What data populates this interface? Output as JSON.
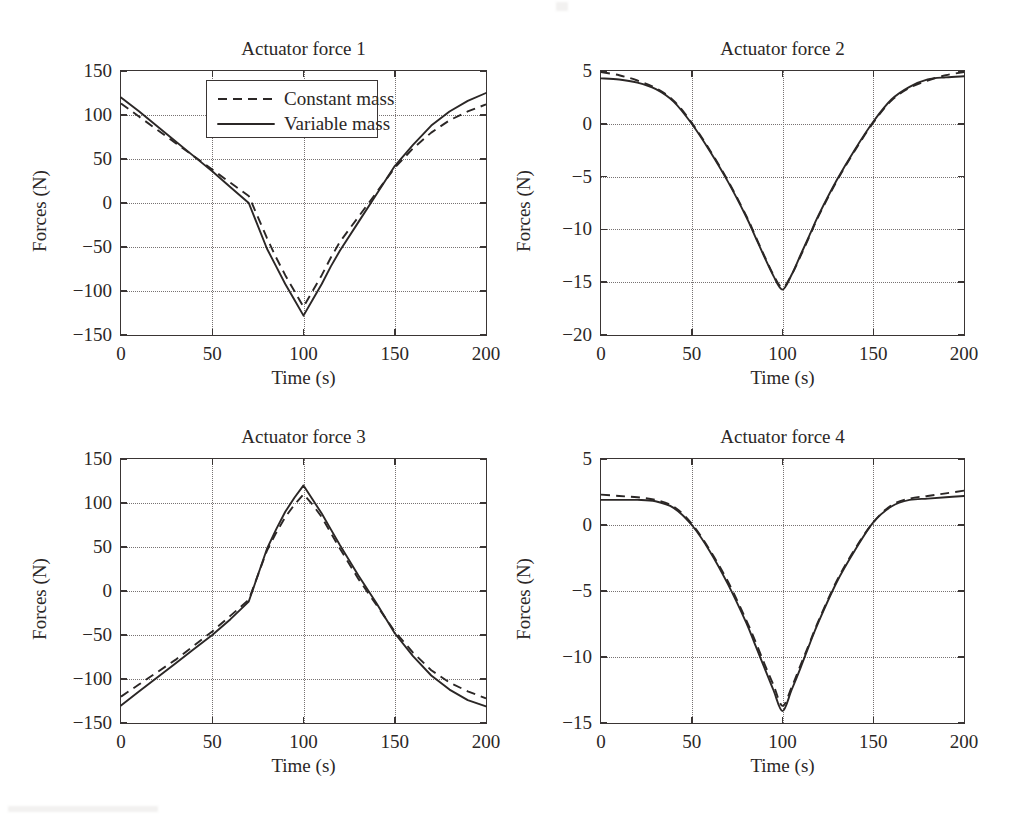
{
  "figure": {
    "background": "#ffffff",
    "ink_color": "#2b2726",
    "grid_color": "#777272"
  },
  "legend": {
    "entries": [
      {
        "label": "Constant mass",
        "style": "dashed"
      },
      {
        "label": "Variable mass",
        "style": "solid"
      }
    ]
  },
  "axis_titles": {
    "x": "Time (s)",
    "y": "Forces (N)"
  },
  "chart_data": [
    {
      "type": "line",
      "title": "Actuator force 1",
      "xlabel": "Time (s)",
      "ylabel": "Forces (N)",
      "xlim": [
        0,
        200
      ],
      "ylim": [
        -150,
        150
      ],
      "xticks": [
        0,
        50,
        100,
        150,
        200
      ],
      "xticklabels": [
        "0",
        "50",
        "100",
        "150",
        "200"
      ],
      "yticks": [
        -150,
        -100,
        -50,
        0,
        50,
        100,
        150
      ],
      "yticklabels": [
        "−150",
        "−100",
        "−50",
        "0",
        "50",
        "100",
        "150"
      ],
      "grid": true,
      "legend": "inside-top-center",
      "x": [
        0,
        10,
        20,
        30,
        40,
        50,
        60,
        70,
        80,
        85,
        90,
        95,
        100,
        105,
        110,
        115,
        120,
        130,
        140,
        150,
        160,
        170,
        180,
        190,
        200
      ],
      "series": [
        {
          "name": "Constant mass",
          "style": "dashed",
          "values": [
            113,
            98,
            83,
            68,
            53,
            38,
            23,
            8,
            -40,
            -62,
            -82,
            -100,
            -118,
            -100,
            -82,
            -62,
            -44,
            -16,
            12,
            40,
            62,
            80,
            94,
            104,
            112
          ]
        },
        {
          "name": "Variable mass",
          "style": "solid",
          "values": [
            120,
            104,
            87,
            70,
            53,
            36,
            18,
            0,
            -52,
            -72,
            -92,
            -110,
            -128,
            -110,
            -92,
            -72,
            -54,
            -22,
            10,
            42,
            66,
            88,
            104,
            116,
            125
          ]
        }
      ]
    },
    {
      "type": "line",
      "title": "Actuator force 2",
      "xlabel": "Time (s)",
      "ylabel": "Forces (N)",
      "xlim": [
        0,
        200
      ],
      "ylim": [
        -20,
        5
      ],
      "xticks": [
        0,
        50,
        100,
        150,
        200
      ],
      "xticklabels": [
        "0",
        "50",
        "100",
        "150",
        "200"
      ],
      "yticks": [
        -20,
        -15,
        -10,
        -5,
        0,
        5
      ],
      "yticklabels": [
        "−20",
        "−15",
        "−10",
        "−5",
        "0",
        "5"
      ],
      "grid": true,
      "x": [
        0,
        10,
        20,
        30,
        40,
        50,
        60,
        70,
        80,
        85,
        90,
        95,
        100,
        105,
        110,
        115,
        120,
        130,
        140,
        150,
        160,
        170,
        180,
        190,
        200
      ],
      "series": [
        {
          "name": "Constant mass",
          "style": "dashed",
          "values": [
            4.9,
            4.6,
            4.1,
            3.4,
            2.2,
            0.1,
            -2.5,
            -5.4,
            -8.7,
            -10.6,
            -12.5,
            -14.3,
            -15.5,
            -14.3,
            -12.5,
            -10.6,
            -8.7,
            -5.4,
            -2.5,
            0.1,
            2.2,
            3.4,
            4.1,
            4.6,
            4.9
          ]
        },
        {
          "name": "Variable mass",
          "style": "solid",
          "values": [
            4.3,
            4.2,
            3.9,
            3.3,
            2.1,
            0.0,
            -2.6,
            -5.5,
            -8.8,
            -10.7,
            -12.6,
            -14.4,
            -15.7,
            -14.3,
            -12.4,
            -10.5,
            -8.6,
            -5.3,
            -2.4,
            0.2,
            2.3,
            3.5,
            4.2,
            4.4,
            4.5
          ]
        }
      ]
    },
    {
      "type": "line",
      "title": "Actuator force 3",
      "xlabel": "Time (s)",
      "ylabel": "Forces (N)",
      "xlim": [
        0,
        200
      ],
      "ylim": [
        -150,
        150
      ],
      "xticks": [
        0,
        50,
        100,
        150,
        200
      ],
      "xticklabels": [
        "0",
        "50",
        "100",
        "150",
        "200"
      ],
      "yticks": [
        -150,
        -100,
        -50,
        0,
        50,
        100,
        150
      ],
      "yticklabels": [
        "−150",
        "−100",
        "−50",
        "0",
        "50",
        "100",
        "150"
      ],
      "grid": true,
      "x": [
        0,
        10,
        20,
        30,
        40,
        50,
        60,
        70,
        80,
        85,
        90,
        95,
        100,
        105,
        110,
        115,
        120,
        130,
        140,
        150,
        160,
        170,
        180,
        190,
        200
      ],
      "series": [
        {
          "name": "Constant mass",
          "style": "dashed",
          "values": [
            -120,
            -106,
            -92,
            -78,
            -62,
            -46,
            -28,
            -10,
            46,
            66,
            84,
            98,
            110,
            98,
            84,
            66,
            48,
            14,
            -16,
            -46,
            -70,
            -90,
            -104,
            -114,
            -122
          ]
        },
        {
          "name": "Variable mass",
          "style": "solid",
          "values": [
            -130,
            -114,
            -98,
            -82,
            -66,
            -50,
            -32,
            -12,
            48,
            70,
            90,
            106,
            120,
            104,
            88,
            70,
            52,
            18,
            -14,
            -48,
            -74,
            -96,
            -112,
            -124,
            -131
          ]
        }
      ]
    },
    {
      "type": "line",
      "title": "Actuator force 4",
      "xlabel": "Time (s)",
      "ylabel": "Forces (N)",
      "xlim": [
        0,
        200
      ],
      "ylim": [
        -15,
        5
      ],
      "xticks": [
        0,
        50,
        100,
        150,
        200
      ],
      "xticklabels": [
        "0",
        "50",
        "100",
        "150",
        "200"
      ],
      "yticks": [
        -15,
        -10,
        -5,
        0,
        5
      ],
      "yticklabels": [
        "−15",
        "−10",
        "−5",
        "0",
        "5"
      ],
      "grid": true,
      "x": [
        0,
        10,
        20,
        30,
        40,
        50,
        60,
        70,
        80,
        85,
        90,
        95,
        100,
        105,
        110,
        115,
        120,
        130,
        140,
        150,
        160,
        170,
        180,
        190,
        200
      ],
      "series": [
        {
          "name": "Constant mass",
          "style": "dashed",
          "values": [
            2.3,
            2.2,
            2.1,
            1.9,
            1.4,
            0.1,
            -1.9,
            -4.3,
            -7.2,
            -8.8,
            -10.5,
            -12.1,
            -13.7,
            -12.3,
            -10.6,
            -8.9,
            -7.2,
            -4.2,
            -1.8,
            0.2,
            1.5,
            2.0,
            2.2,
            2.4,
            2.6
          ]
        },
        {
          "name": "Variable mass",
          "style": "solid",
          "values": [
            1.9,
            1.9,
            1.9,
            1.8,
            1.3,
            0.0,
            -2.0,
            -4.5,
            -7.4,
            -9.1,
            -10.8,
            -12.5,
            -14.1,
            -12.5,
            -10.8,
            -9.0,
            -7.3,
            -4.3,
            -1.9,
            0.2,
            1.4,
            1.9,
            2.0,
            2.1,
            2.2
          ]
        }
      ]
    }
  ]
}
